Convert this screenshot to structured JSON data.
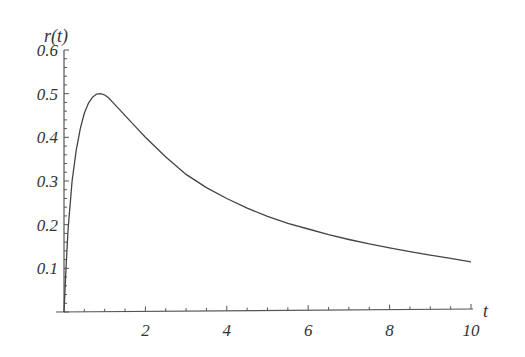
{
  "chart_data": {
    "type": "line",
    "title": "",
    "xlabel": "t",
    "ylabel": "r(t)",
    "xlim": [
      0,
      10
    ],
    "ylim": [
      0,
      0.6
    ],
    "x_ticks": [
      2,
      4,
      6,
      8,
      10
    ],
    "y_ticks": [
      0.1,
      0.2,
      0.3,
      0.4,
      0.5,
      0.6
    ],
    "x_tick_labels": [
      "2",
      "4",
      "6",
      "8",
      "10"
    ],
    "y_tick_labels": [
      "0.1",
      "0.2",
      "0.3",
      "0.4",
      "0.5",
      "0.6"
    ],
    "grid": false,
    "legend": null,
    "series": [
      {
        "name": "r(t)",
        "color": "#444444",
        "x": [
          0,
          0.05,
          0.1,
          0.2,
          0.3,
          0.4,
          0.5,
          0.6,
          0.7,
          0.8,
          0.9,
          1.0,
          1.1,
          1.2,
          1.4,
          1.6,
          1.8,
          2.0,
          2.5,
          3.0,
          3.5,
          4.0,
          4.5,
          5.0,
          5.5,
          6.0,
          6.5,
          7.0,
          7.5,
          8.0,
          8.5,
          9.0,
          9.5,
          10.0
        ],
        "y": [
          0,
          0.1,
          0.19,
          0.3,
          0.37,
          0.42,
          0.455,
          0.478,
          0.492,
          0.499,
          0.5,
          0.497,
          0.49,
          0.48,
          0.46,
          0.44,
          0.42,
          0.4,
          0.355,
          0.315,
          0.285,
          0.26,
          0.238,
          0.219,
          0.203,
          0.19,
          0.177,
          0.166,
          0.156,
          0.147,
          0.138,
          0.13,
          0.123,
          0.115
        ]
      }
    ]
  }
}
